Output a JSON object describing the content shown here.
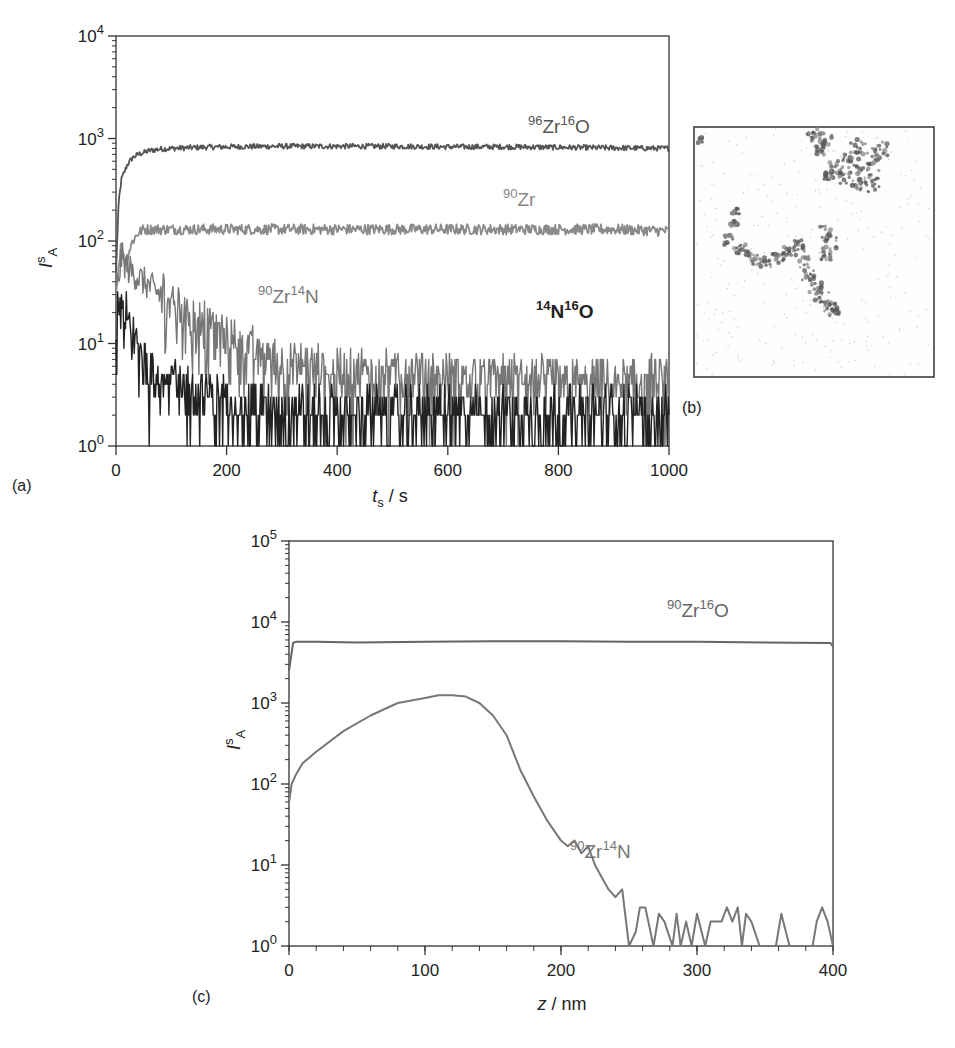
{
  "figure": {
    "panels": [
      "(a)",
      "(b)",
      "(c)"
    ]
  },
  "chart_data": [
    {
      "panel": "(a)",
      "type": "line",
      "title": "",
      "xlabel": "t_s / s",
      "xlabel_main": "t",
      "xlabel_sub": "s",
      "xlabel_unit": " / s",
      "ylabel": "I^s_A",
      "ylabel_main": "I",
      "ylabel_sup": "s",
      "ylabel_sub": "A",
      "yscale": "log",
      "xlim": [
        0,
        1000
      ],
      "ylim": [
        1,
        10000
      ],
      "x_ticks": [
        "0",
        "200",
        "400",
        "600",
        "800",
        "1000"
      ],
      "y_ticks": [
        {
          "base": "10",
          "exp": "0"
        },
        {
          "base": "10",
          "exp": "1"
        },
        {
          "base": "10",
          "exp": "2"
        },
        {
          "base": "10",
          "exp": "3"
        },
        {
          "base": "10",
          "exp": "4"
        }
      ],
      "grid": false,
      "series": [
        {
          "name": "96Zr16O",
          "label_parts": [
            {
              "sup": "96"
            },
            {
              "t": "Zr"
            },
            {
              "sup": "16"
            },
            {
              "t": "O"
            }
          ],
          "color": "#555555",
          "x": [
            0,
            5,
            10,
            20,
            30,
            40,
            60,
            80,
            100,
            150,
            200,
            300,
            400,
            500,
            600,
            700,
            800,
            900,
            1000
          ],
          "y": [
            50,
            250,
            400,
            550,
            650,
            700,
            760,
            790,
            800,
            820,
            830,
            840,
            840,
            840,
            830,
            830,
            820,
            810,
            800
          ]
        },
        {
          "name": "90Zr",
          "label_parts": [
            {
              "sup": "90"
            },
            {
              "t": "Zr"
            }
          ],
          "color": "#8a8a8a",
          "x": [
            0,
            5,
            10,
            15,
            20,
            30,
            40,
            50,
            100,
            200,
            300,
            400,
            500,
            600,
            700,
            800,
            900,
            1000
          ],
          "y": [
            30,
            60,
            100,
            60,
            70,
            100,
            120,
            130,
            130,
            130,
            130,
            130,
            130,
            130,
            130,
            130,
            130,
            125
          ]
        },
        {
          "name": "90Zr14N",
          "label_parts": [
            {
              "sup": "90"
            },
            {
              "t": "Zr"
            },
            {
              "sup": "14"
            },
            {
              "t": "N"
            }
          ],
          "color": "#777777",
          "x": [
            0,
            10,
            20,
            50,
            100,
            150,
            200,
            250,
            300,
            400,
            500,
            600,
            700,
            800,
            900,
            1000
          ],
          "y": [
            30,
            70,
            55,
            40,
            25,
            15,
            11,
            8,
            6,
            5,
            5,
            4.5,
            4.5,
            4,
            4,
            4
          ]
        },
        {
          "name": "14N16O",
          "label_parts": [
            {
              "sup": "14"
            },
            {
              "t": "N"
            },
            {
              "sup": "16"
            },
            {
              "t": "O"
            }
          ],
          "color": "#222222",
          "x": [
            0,
            10,
            20,
            40,
            60,
            100,
            150,
            200,
            300,
            400,
            500,
            600,
            700,
            800,
            900,
            1000
          ],
          "y": [
            15,
            18,
            15,
            8,
            6,
            4,
            3,
            2.5,
            2,
            2,
            2,
            2,
            2,
            2,
            2,
            2
          ]
        }
      ]
    },
    {
      "panel": "(b)",
      "type": "heatmap",
      "title": "",
      "description": "grayscale lateral ion image with dark curved features on light background"
    },
    {
      "panel": "(c)",
      "type": "line",
      "title": "",
      "xlabel": "z / nm",
      "xlabel_main": "z",
      "xlabel_unit": " / nm",
      "ylabel": "I^s_A",
      "ylabel_main": "I",
      "ylabel_sup": "s",
      "ylabel_sub": "A",
      "yscale": "log",
      "xlim": [
        0,
        400
      ],
      "ylim": [
        1,
        100000
      ],
      "x_ticks": [
        "0",
        "100",
        "200",
        "300",
        "400"
      ],
      "y_ticks": [
        {
          "base": "10",
          "exp": "0"
        },
        {
          "base": "10",
          "exp": "1"
        },
        {
          "base": "10",
          "exp": "2"
        },
        {
          "base": "10",
          "exp": "3"
        },
        {
          "base": "10",
          "exp": "4"
        },
        {
          "base": "10",
          "exp": "5"
        }
      ],
      "grid": false,
      "series": [
        {
          "name": "90Zr16O",
          "label_parts": [
            {
              "sup": "90"
            },
            {
              "t": "Zr"
            },
            {
              "sup": "16"
            },
            {
              "t": "O"
            }
          ],
          "color": "#666666",
          "x": [
            0,
            3,
            5,
            20,
            50,
            100,
            150,
            200,
            250,
            300,
            350,
            398,
            400
          ],
          "y": [
            2500,
            5500,
            5700,
            5700,
            5600,
            5700,
            5800,
            5800,
            5700,
            5700,
            5600,
            5500,
            5000
          ]
        },
        {
          "name": "90Zr14N",
          "label_parts": [
            {
              "sup": "90"
            },
            {
              "t": "Zr"
            },
            {
              "sup": "14"
            },
            {
              "t": "N"
            }
          ],
          "color": "#777777",
          "x": [
            0,
            2,
            5,
            10,
            20,
            40,
            60,
            80,
            100,
            110,
            120,
            130,
            140,
            150,
            160,
            170,
            180,
            190,
            200,
            205,
            210,
            215,
            220,
            225,
            230,
            235,
            240,
            245,
            250,
            255,
            258,
            262,
            268,
            272,
            276,
            282,
            285,
            288,
            292,
            296,
            300,
            306,
            310,
            318,
            322,
            326,
            330,
            333,
            336,
            340,
            346,
            358,
            362,
            368,
            376,
            385,
            388,
            392,
            396,
            400
          ],
          "y": [
            60,
            100,
            130,
            180,
            250,
            450,
            700,
            1000,
            1150,
            1250,
            1250,
            1200,
            1000,
            700,
            400,
            150,
            70,
            35,
            20,
            17,
            20,
            14,
            17,
            10,
            7,
            5,
            4,
            5,
            1,
            1.5,
            3,
            3,
            1,
            2.5,
            2,
            1,
            2.5,
            1,
            2,
            1,
            2.5,
            1,
            2,
            2,
            3,
            2,
            3,
            1,
            2.5,
            2,
            1,
            1,
            2.5,
            1,
            1,
            1,
            2,
            3,
            2,
            1
          ]
        }
      ]
    }
  ]
}
